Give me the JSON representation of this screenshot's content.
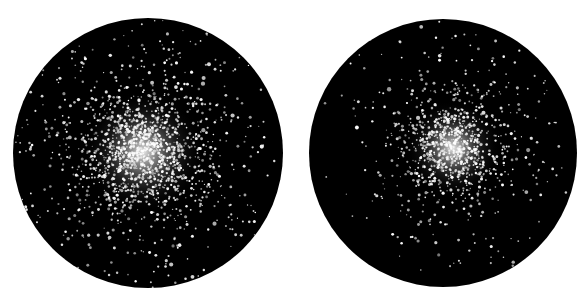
{
  "canvas": {
    "width": 588,
    "height": 303,
    "background": "#ffffff"
  },
  "views": [
    {
      "id": "left",
      "label": "Globular cluster eyepiece view (left)",
      "circle": {
        "cx": 148,
        "cy": 153,
        "r": 135
      },
      "core": {
        "x": 143,
        "y": 152,
        "glow_radius": 38,
        "spread": 30
      },
      "cluster_star_count": 1400,
      "field_star_count": 170,
      "seed": 7
    },
    {
      "id": "right",
      "label": "Globular cluster eyepiece view (right)",
      "circle": {
        "cx": 443,
        "cy": 153,
        "r": 134
      },
      "core": {
        "x": 453,
        "y": 148,
        "glow_radius": 30,
        "spread": 24
      },
      "cluster_star_count": 900,
      "field_star_count": 110,
      "seed": 23
    }
  ],
  "colors": {
    "sky": "#000000",
    "star": "#ffffff",
    "core_glow": "#e8e8e8"
  }
}
